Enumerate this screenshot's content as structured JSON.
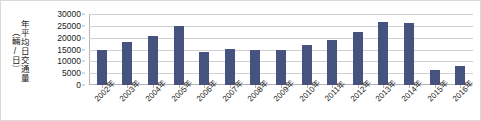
{
  "chart_data": {
    "type": "bar",
    "title": "",
    "xlabel": "",
    "ylabel_lines": [
      "年平均日交通量",
      "（輛/日）"
    ],
    "categories": [
      "2002年",
      "2003年",
      "2004年",
      "2005年",
      "2006年",
      "2007年",
      "2008年",
      "2009年",
      "2010年",
      "2011年",
      "2012年",
      "2013年",
      "2014年",
      "2015年",
      "2016年"
    ],
    "values": [
      15000,
      18000,
      20500,
      25000,
      14000,
      15300,
      15000,
      15000,
      17000,
      19000,
      22500,
      26500,
      26000,
      6500,
      8000
    ],
    "series": [
      {
        "name": "年平均日交通量",
        "values": [
          15000,
          18000,
          20500,
          25000,
          14000,
          15300,
          15000,
          15000,
          17000,
          19000,
          22500,
          26500,
          26000,
          6500,
          8000
        ]
      }
    ],
    "ylim": [
      0,
      30000
    ],
    "y_ticks": [
      0,
      5000,
      10000,
      15000,
      20000,
      25000,
      30000
    ],
    "y_tick_labels": [
      "0",
      "5000",
      "10000",
      "15000",
      "20000",
      "25000",
      "30000"
    ],
    "grid": true,
    "legend": "none",
    "bar_color": "#47537f",
    "gridline_color": "#d0d0d0",
    "axis_color": "#b3b3b3",
    "background_color": "#ffffff"
  }
}
